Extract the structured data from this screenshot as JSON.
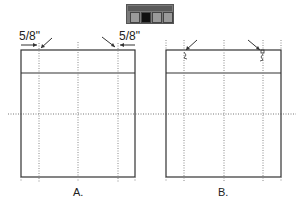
{
  "toolbar": {
    "buttons": [
      {
        "name": "pen-tool-icon",
        "active": false
      },
      {
        "name": "selection-tool-icon",
        "active": true
      },
      {
        "name": "anchor-tool-icon",
        "active": false
      },
      {
        "name": "direct-select-tool-icon",
        "active": false
      }
    ]
  },
  "diagram_a": {
    "label": "A.",
    "left_measure": "5/8\"",
    "right_measure": "5/8\""
  },
  "diagram_b": {
    "label": "B."
  },
  "colors": {
    "line": "#333333",
    "guide": "#777777",
    "toolbar_bg": "#7a7a7a"
  }
}
